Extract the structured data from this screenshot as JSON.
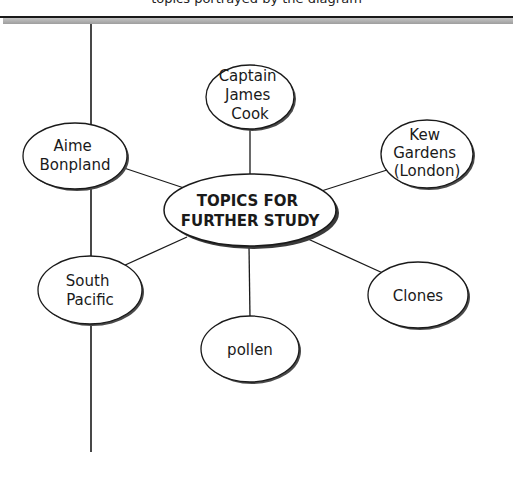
{
  "header": {
    "text": "topics portrayed by the diagram"
  },
  "diagram": {
    "type": "concept-web",
    "center": {
      "lines": [
        "TOPICS FOR",
        "FURTHER STUDY"
      ]
    },
    "nodes": [
      {
        "id": "captain-james-cook",
        "lines": [
          "Captain",
          "James",
          "Cook"
        ]
      },
      {
        "id": "kew-gardens",
        "lines": [
          "Kew",
          "Gardens",
          "(London)"
        ]
      },
      {
        "id": "aime-bonpland",
        "lines": [
          "Aime",
          "Bonpland"
        ]
      },
      {
        "id": "south-pacific",
        "lines": [
          "South",
          "Pacific"
        ]
      },
      {
        "id": "clones",
        "lines": [
          "Clones"
        ]
      },
      {
        "id": "pollen",
        "lines": [
          "pollen"
        ]
      }
    ],
    "colors": {
      "stroke": "#1a1a1a",
      "shadow": "#4a4a4a",
      "fill": "#ffffff",
      "rule_gray": "#a8a8a8"
    }
  }
}
